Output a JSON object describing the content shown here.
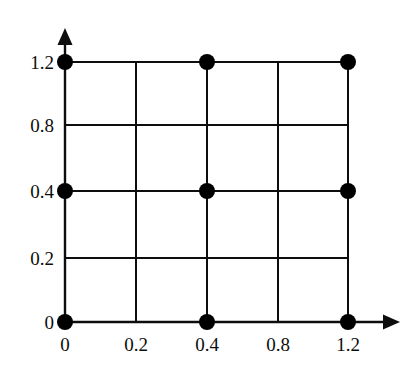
{
  "figure": {
    "background_color": "#ffffff",
    "line_color": "#0d0d0d",
    "marker_color": "#000000",
    "width": 420,
    "height": 373
  },
  "chart_data": {
    "type": "scatter",
    "title": "",
    "subtitle": "",
    "xlabel": "",
    "ylabel": "",
    "grid": true,
    "legend": null,
    "x_tick_labels": [
      "0",
      "0.2",
      "0.4",
      "0.8",
      "1.2"
    ],
    "y_tick_labels": [
      "0",
      "0.2",
      "0.4",
      "0.8",
      "1.2"
    ],
    "x_tick_values": [
      0,
      0.2,
      0.4,
      0.8,
      1.2
    ],
    "y_tick_values": [
      0,
      0.2,
      0.4,
      0.8,
      1.2
    ],
    "x_tick_pixels": [
      65,
      136,
      207,
      278,
      348
    ],
    "y_tick_pixels": [
      322,
      258,
      191,
      125,
      62
    ],
    "xlim": [
      0,
      1.2
    ],
    "ylim": [
      0,
      1.2
    ],
    "axis_arrows": {
      "x_arrow_tip_px": 400,
      "y_arrow_tip_px": 28
    },
    "grid_lines": {
      "vertical_x_pixels": [
        65,
        136,
        207,
        278,
        348
      ],
      "horizontal_y_pixels": [
        62,
        125,
        191,
        258,
        322
      ]
    },
    "markers": {
      "shape": "circle",
      "size_px": 16,
      "color": "#000000",
      "x": [
        0,
        0.4,
        1.2,
        0,
        0.4,
        1.2,
        0,
        0.4,
        1.2
      ],
      "y": [
        0,
        0,
        0,
        0.4,
        0.4,
        0.4,
        1.2,
        1.2,
        1.2
      ],
      "points": [
        {
          "x": 0,
          "y": 0,
          "px": 65,
          "py": 322
        },
        {
          "x": 0.4,
          "y": 0,
          "px": 207,
          "py": 322
        },
        {
          "x": 1.2,
          "y": 0,
          "px": 348,
          "py": 322
        },
        {
          "x": 0,
          "y": 0.4,
          "px": 65,
          "py": 191
        },
        {
          "x": 0.4,
          "y": 0.4,
          "px": 207,
          "py": 191
        },
        {
          "x": 1.2,
          "y": 0.4,
          "px": 348,
          "py": 191
        },
        {
          "x": 0,
          "y": 1.2,
          "px": 65,
          "py": 62
        },
        {
          "x": 0.4,
          "y": 1.2,
          "px": 207,
          "py": 62
        },
        {
          "x": 1.2,
          "y": 1.2,
          "px": 348,
          "py": 62
        }
      ]
    }
  }
}
